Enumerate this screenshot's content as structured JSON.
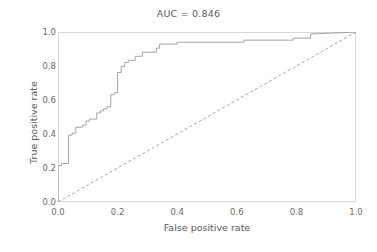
{
  "chart_data": {
    "type": "line",
    "title": "AUC = 0.846",
    "xlabel": "False positive rate",
    "ylabel": "True positive rate",
    "xlim": [
      0.0,
      1.0
    ],
    "ylim": [
      0.0,
      1.0
    ],
    "xticks": [
      "0.0",
      "0.2",
      "0.4",
      "0.6",
      "0.8",
      "1.0"
    ],
    "xtick_values": [
      0.0,
      0.2,
      0.4,
      0.6,
      0.8,
      1.0
    ],
    "yticks": [
      "0.0",
      "0.2",
      "0.4",
      "0.6",
      "0.8",
      "1.0"
    ],
    "ytick_values": [
      0.0,
      0.2,
      0.4,
      0.6,
      0.8,
      1.0
    ],
    "grid": false,
    "legend": "none",
    "auc": 0.846,
    "line_color": "#9a9a9a",
    "reference_line_color": "#9a9a9a",
    "series": [
      {
        "name": "ROC curve",
        "style": "step",
        "x": [
          0.0,
          0.0,
          0.012,
          0.012,
          0.035,
          0.035,
          0.047,
          0.047,
          0.06,
          0.06,
          0.082,
          0.082,
          0.094,
          0.094,
          0.106,
          0.106,
          0.13,
          0.13,
          0.142,
          0.142,
          0.153,
          0.153,
          0.165,
          0.165,
          0.177,
          0.177,
          0.189,
          0.189,
          0.2,
          0.2,
          0.212,
          0.212,
          0.224,
          0.224,
          0.236,
          0.236,
          0.259,
          0.259,
          0.283,
          0.283,
          0.33,
          0.33,
          0.341,
          0.341,
          0.4,
          0.4,
          0.624,
          0.624,
          0.789,
          0.789,
          0.848,
          0.848,
          1.0
        ],
        "y": [
          0.0,
          0.214,
          0.214,
          0.226,
          0.226,
          0.393,
          0.393,
          0.405,
          0.405,
          0.44,
          0.44,
          0.452,
          0.452,
          0.476,
          0.476,
          0.488,
          0.488,
          0.524,
          0.524,
          0.536,
          0.536,
          0.548,
          0.548,
          0.56,
          0.56,
          0.631,
          0.631,
          0.643,
          0.643,
          0.762,
          0.762,
          0.798,
          0.798,
          0.821,
          0.821,
          0.833,
          0.833,
          0.857,
          0.857,
          0.881,
          0.881,
          0.905,
          0.905,
          0.929,
          0.929,
          0.94,
          0.94,
          0.952,
          0.952,
          0.964,
          0.964,
          0.988,
          1.0
        ]
      },
      {
        "name": "Chance reference",
        "style": "dashed",
        "x": [
          0.0,
          1.0
        ],
        "y": [
          0.0,
          1.0
        ]
      }
    ]
  }
}
